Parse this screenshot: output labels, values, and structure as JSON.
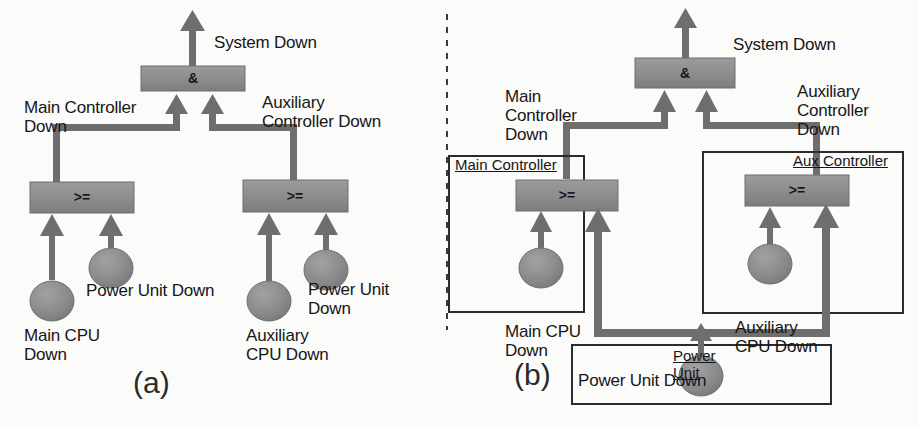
{
  "figure": {
    "type": "fault-tree-diagram",
    "panels": [
      {
        "tag": "(a)",
        "name": "flat-fault-tree",
        "top_event": "System Down",
        "top_gate": "&",
        "gates": [
          {
            "symbol": "&",
            "label": "System Down"
          },
          {
            "symbol": ">=",
            "label": "Main Controller\nDown"
          },
          {
            "symbol": ">=",
            "label": "Auxiliary\nController Down"
          }
        ],
        "labels": {
          "system_down": "System Down",
          "main_controller_down": "Main Controller\nDown",
          "aux_controller_down": "Auxiliary\nController Down",
          "main_cpu_down": "Main CPU\nDown",
          "power_unit_down_left": "Power Unit Down",
          "aux_cpu_down": "Auxiliary\nCPU Down",
          "power_unit_down_right": "Power Unit\nDown"
        },
        "basic_events": [
          "Main CPU Down",
          "Power Unit Down",
          "Auxiliary CPU Down",
          "Power Unit Down"
        ]
      },
      {
        "tag": "(b)",
        "name": "modular-fault-tree",
        "top_event": "System Down",
        "top_gate": "&",
        "containers": [
          {
            "title": "Main Controller"
          },
          {
            "title": "Aux Controller"
          },
          {
            "title": "Power\nUnit"
          }
        ],
        "labels": {
          "system_down": "System Down",
          "main_controller_down": "Main\nController\nDown",
          "aux_controller_down": "Auxiliary\nController\nDown",
          "main_controller_box": "Main Controller",
          "aux_controller_box": "Aux Controller",
          "power_unit_box": "Power\nUnit",
          "main_cpu_down": "Main CPU\nDown",
          "aux_cpu_down": "Auxiliary\nCPU Down",
          "power_unit_down": "Power Unit Down"
        },
        "basic_events": [
          "Main CPU Down",
          "Auxiliary CPU Down",
          "Power Unit Down"
        ]
      }
    ],
    "gate_symbols": {
      "and": "&",
      "or": ">="
    },
    "colors": {
      "gate_fill": "#8d8d8d",
      "gate_stroke": "#6f6f6f",
      "event_fill": "#8a8a8a",
      "event_stroke": "#6a6a6a",
      "connector": "#6e6e6e",
      "container_stroke": "#2b2b2b",
      "text": "#161616",
      "background": "#fbfbfa"
    }
  }
}
